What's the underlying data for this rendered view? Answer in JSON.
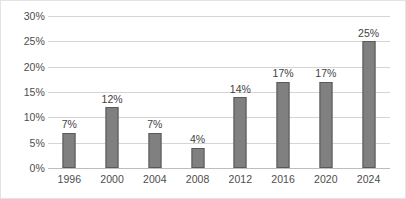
{
  "chart_data": {
    "type": "bar",
    "title": "",
    "subtitle": "",
    "xlabel": "",
    "ylabel": "",
    "categories": [
      "1996",
      "2000",
      "2004",
      "2008",
      "2012",
      "2016",
      "2020",
      "2024"
    ],
    "values": [
      7,
      12,
      7,
      4,
      14,
      17,
      17,
      25
    ],
    "data_labels": [
      "7%",
      "12%",
      "7%",
      "4%",
      "14%",
      "17%",
      "17%",
      "25%"
    ],
    "ylim": [
      0,
      30
    ],
    "ytick_values": [
      0,
      5,
      10,
      15,
      20,
      25,
      30
    ],
    "ytick_labels": [
      "0%",
      "5%",
      "10%",
      "15%",
      "20%",
      "25%",
      "30%"
    ],
    "grid": "horizontal",
    "legend": "none",
    "annotations": [],
    "colors": {
      "bar_fill": "#808080",
      "bar_border": "#595959",
      "gridline": "#d4d4d4",
      "baseline": "#bdbdbd",
      "axis_text": "#4d4d4d",
      "label_text": "#3f3f3f",
      "frame_border": "#e3e3e3",
      "background": "#ffffff"
    }
  }
}
